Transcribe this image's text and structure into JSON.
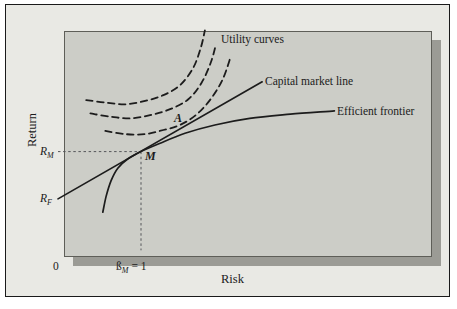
{
  "figure": {
    "y_axis_title": "Return",
    "x_axis_title": "Risk",
    "origin_label": "0",
    "curve_labels": {
      "utility": "Utility curves",
      "cml": "Capital market line",
      "frontier": "Efficient frontier"
    },
    "point_labels": {
      "a": "A",
      "m": "M"
    },
    "tick_rm": {
      "base": "R",
      "sub": "M"
    },
    "tick_rf": {
      "base": "R",
      "sub": "F"
    },
    "tick_beta": {
      "base": "ß",
      "sub": "M",
      "eq": "= 1"
    },
    "colors": {
      "page": "#ffffff",
      "frame_bg": "#e9e9e4",
      "plot_bg": "#cccdc7",
      "shadow": "#9b9b95",
      "line": "#1c1c1c",
      "guide": "#55565a"
    }
  },
  "chart_data": {
    "type": "line",
    "title": "",
    "xlabel": "Risk",
    "ylabel": "Return",
    "x_unit": "beta (market beta = 1 marked)",
    "y_unit": "return (relative units, unlabeled axis)",
    "xlim": [
      0,
      4.4
    ],
    "ylim": [
      0,
      2.72
    ],
    "grid": false,
    "legend": "inline annotations",
    "series": [
      {
        "name": "Capital market line",
        "style": "solid",
        "points": [
          [
            0,
            0.64
          ],
          [
            2.46,
            2.05
          ]
        ]
      },
      {
        "name": "Efficient frontier",
        "style": "solid",
        "points": [
          [
            0.54,
            0.48
          ],
          [
            0.58,
            0.67
          ],
          [
            0.64,
            0.86
          ],
          [
            0.72,
            1.01
          ],
          [
            0.84,
            1.12
          ],
          [
            1.0,
            1.21
          ],
          [
            1.23,
            1.31
          ],
          [
            1.53,
            1.43
          ],
          [
            1.89,
            1.53
          ],
          [
            2.31,
            1.61
          ],
          [
            2.8,
            1.66
          ],
          [
            3.33,
            1.7
          ]
        ]
      },
      {
        "name": "Utility curve 1",
        "style": "dashed",
        "points": [
          [
            0.34,
            1.83
          ],
          [
            0.57,
            1.8
          ],
          [
            0.81,
            1.78
          ],
          [
            1.05,
            1.82
          ],
          [
            1.27,
            1.89
          ],
          [
            1.47,
            2.01
          ],
          [
            1.63,
            2.22
          ],
          [
            1.72,
            2.46
          ],
          [
            1.77,
            2.67
          ]
        ]
      },
      {
        "name": "Utility curve 2",
        "style": "dashed",
        "points": [
          [
            0.39,
            1.67
          ],
          [
            0.63,
            1.63
          ],
          [
            0.87,
            1.61
          ],
          [
            1.11,
            1.65
          ],
          [
            1.35,
            1.72
          ],
          [
            1.57,
            1.84
          ],
          [
            1.73,
            2.04
          ],
          [
            1.84,
            2.28
          ],
          [
            1.9,
            2.49
          ]
        ]
      },
      {
        "name": "Utility curve 3",
        "style": "dashed",
        "points": [
          [
            0.57,
            1.46
          ],
          [
            0.81,
            1.42
          ],
          [
            1.05,
            1.42
          ],
          [
            1.27,
            1.47
          ],
          [
            1.47,
            1.53
          ],
          [
            1.66,
            1.65
          ],
          [
            1.83,
            1.83
          ],
          [
            1.98,
            2.07
          ],
          [
            2.08,
            2.35
          ]
        ]
      }
    ],
    "guides": [
      {
        "name": "rm-dashed-guide",
        "points": [
          [
            0,
            1.21
          ],
          [
            1,
            1.21
          ]
        ]
      },
      {
        "name": "beta-dashed-guide",
        "points": [
          [
            1,
            1.21
          ],
          [
            1,
            0.02
          ]
        ]
      }
    ],
    "key_points": [
      {
        "label": "M",
        "x": 1.0,
        "y": 1.21,
        "meaning": "market portfolio tangency, at ß_M = 1, return R_M"
      },
      {
        "label": "A",
        "x": 1.52,
        "y": 1.54,
        "meaning": "utility curve crossing on capital market line"
      }
    ],
    "y_marks": [
      {
        "label": "R_M",
        "y": 1.21
      },
      {
        "label": "R_F",
        "y": 0.64
      }
    ],
    "x_marks": [
      {
        "label": "0",
        "x": 0
      },
      {
        "label": "ß_M = 1",
        "x": 1.0
      }
    ]
  }
}
